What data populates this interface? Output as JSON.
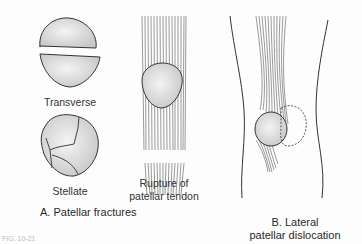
{
  "diagram": {
    "panel_a": {
      "caption": "A. Patellar fractures",
      "items": [
        {
          "label": "Transverse"
        },
        {
          "label": "Stellate"
        },
        {
          "label_line1": "Rupture of",
          "label_line2": "patellar tendon"
        }
      ]
    },
    "panel_b": {
      "caption_line1": "B. Lateral",
      "caption_line2": "patellar dislocation"
    },
    "figure_number": "FIG. 10-21"
  },
  "colors": {
    "bone_fill": "#dcdcdc",
    "outline": "#333333",
    "tendon": "#555555",
    "background": "#fdfdfd"
  }
}
